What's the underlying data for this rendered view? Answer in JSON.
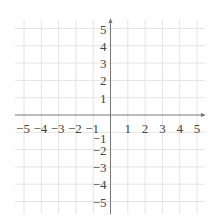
{
  "chart_data": {
    "type": "line",
    "title": "",
    "xlabel": "",
    "ylabel": "",
    "xlim": [
      -5,
      5
    ],
    "ylim": [
      -5,
      5
    ],
    "grid": true,
    "x_ticks": [
      -5,
      -4,
      -3,
      -2,
      -1,
      1,
      2,
      3,
      4,
      5
    ],
    "y_ticks": [
      5,
      4,
      3,
      2,
      1,
      -1,
      -2,
      -3,
      -4,
      -5
    ],
    "x_tick_labels": [
      "−5",
      "−4",
      "−3",
      "−2",
      "−1",
      "1",
      "2",
      "3",
      "4",
      "5"
    ],
    "y_tick_labels": [
      "5",
      "4",
      "3",
      "2",
      "1",
      "−1",
      "−2",
      "−3",
      "−4",
      "−5"
    ],
    "series": [],
    "axes_arrows": true
  },
  "colors": {
    "grid": "#e4e4e4",
    "axis": "#777777",
    "tick_text": "#444444"
  }
}
